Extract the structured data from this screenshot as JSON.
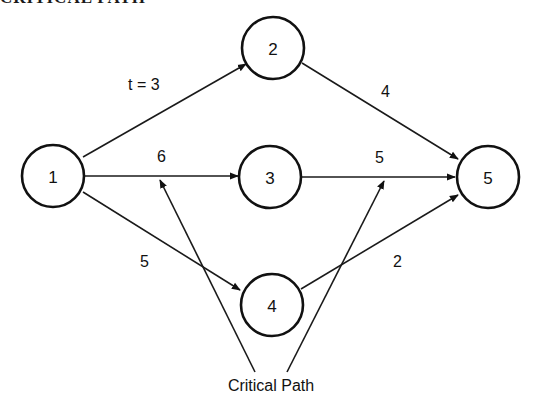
{
  "title": "CRITICAL PATH",
  "nodes": [
    {
      "id": "1",
      "label": "1",
      "cx": 53,
      "cy": 176
    },
    {
      "id": "2",
      "label": "2",
      "cx": 273,
      "cy": 48
    },
    {
      "id": "3",
      "label": "3",
      "cx": 270,
      "cy": 177
    },
    {
      "id": "4",
      "label": "4",
      "cx": 272,
      "cy": 305
    },
    {
      "id": "5",
      "label": "5",
      "cx": 488,
      "cy": 177
    }
  ],
  "edges": [
    {
      "from": "1",
      "to": "2",
      "label": "t = 3"
    },
    {
      "from": "1",
      "to": "3",
      "label": "6"
    },
    {
      "from": "1",
      "to": "4",
      "label": "5"
    },
    {
      "from": "2",
      "to": "5",
      "label": "4"
    },
    {
      "from": "3",
      "to": "5",
      "label": "5"
    },
    {
      "from": "4",
      "to": "5",
      "label": "2"
    }
  ],
  "annotation": {
    "label": "Critical Path",
    "points_to": [
      "edge 1-3",
      "edge 3-5"
    ]
  }
}
